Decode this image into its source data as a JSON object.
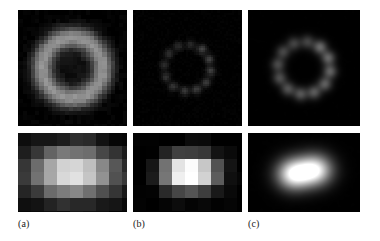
{
  "figure": {
    "caption_labels": [
      {
        "id": "a",
        "text": "(a)"
      },
      {
        "id": "b",
        "text": "(b)"
      },
      {
        "id": "c",
        "text": "(c)"
      }
    ],
    "background_color": "#ffffff",
    "panel_background_color": "#000000",
    "rows": 2,
    "columns": 3
  },
  "chart_data": {
    "type": "heatmap",
    "title": "",
    "xlabel": "",
    "ylabel": "",
    "colormap": "grayscale",
    "value_range": [
      0,
      255
    ],
    "layout": {
      "rows": 2,
      "cols": 3,
      "grid": false,
      "legend": "none"
    },
    "panels": [
      {
        "id": "a-top",
        "column_label": "(a)",
        "row": "top",
        "description": "coarsely pixelated bright annulus (ring) with dark center on black background",
        "grid_size": [
          26,
          26
        ],
        "pattern": "annulus",
        "ring_radius_px": 7.2,
        "ring_inner_radius_px": 3.4,
        "ring_width_px": 3.6,
        "peak_intensity": 150,
        "center_intensity": 18,
        "pixel_block": 4.2,
        "blur": 0.9,
        "noise": 7,
        "lobes": 0
      },
      {
        "id": "b-top",
        "column_label": "(b)",
        "row": "top",
        "description": "faint ring composed of discrete small dots, very low contrast",
        "grid_size": [
          52,
          52
        ],
        "pattern": "dotted-ring",
        "ring_radius_px": 24,
        "lobes": 12,
        "lobe_sigma_px": 2.6,
        "peak_intensity": 72,
        "center_intensity": 4,
        "pixel_block": 2.1,
        "blur": 0.5,
        "noise": 4
      },
      {
        "id": "c-top",
        "column_label": "(c)",
        "row": "top",
        "description": "smooth ring of twelve resolved Gaussian blobs, moderate brightness",
        "grid_size": [
          112,
          112
        ],
        "pattern": "dotted-ring",
        "ring_radius_px": 27,
        "lobes": 12,
        "lobe_sigma_px": 4.6,
        "peak_intensity": 108,
        "center_intensity": 4,
        "pixel_block": 1,
        "blur": 2.2,
        "noise": 3
      },
      {
        "id": "a-bottom",
        "column_label": "(a)",
        "row": "bottom",
        "description": "coarse pixel blocks forming a single broad horizontal bright bar, saturated center",
        "grid_size": [
          17,
          12
        ],
        "pattern": "single-blob",
        "blob_centers": [
          [
            0.5,
            0.5
          ]
        ],
        "blob_sigma_x_px": 17,
        "blob_sigma_y_px": 10,
        "peak_intensity": 255,
        "pixel_block": 13,
        "blur": 0.3,
        "noise": 9
      },
      {
        "id": "b-bottom",
        "column_label": "(b)",
        "row": "bottom",
        "description": "pixel blocks with a bright saturated left cell and dimmer neighbours forming a cross-like cluster",
        "grid_size": [
          17,
          12
        ],
        "pattern": "double-blob",
        "blob_centers": [
          [
            0.42,
            0.5
          ],
          [
            0.62,
            0.5
          ]
        ],
        "blob_sigma_x_px": 8,
        "blob_sigma_y_px": 7,
        "peak_intensity": 255,
        "pixel_block": 13,
        "blur": 0.3,
        "noise": 7
      },
      {
        "id": "c-bottom",
        "column_label": "(c)",
        "row": "bottom",
        "description": "two smooth well-resolved bright Gaussian lobes side by side, slightly overlapping",
        "grid_size": [
          112,
          79
        ],
        "pattern": "double-blob",
        "blob_centers": [
          [
            0.41,
            0.52
          ],
          [
            0.6,
            0.47
          ]
        ],
        "blob_sigma_x_px": 10,
        "blob_sigma_y_px": 9,
        "peak_intensity": 255,
        "pixel_block": 1,
        "blur": 2.0,
        "noise": 3
      }
    ]
  }
}
